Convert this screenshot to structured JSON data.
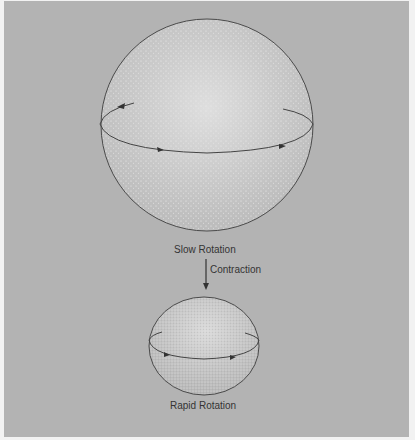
{
  "diagram": {
    "top_sphere": {
      "label": "Slow Rotation",
      "cx": 207,
      "cy": 125,
      "r": 106
    },
    "process": {
      "label": "Contraction"
    },
    "bottom_sphere": {
      "label": "Rapid Rotation",
      "cx": 204,
      "cy": 346,
      "rx": 55,
      "ry": 49
    },
    "colors": {
      "background": "#b3b3b3",
      "sphere_fill": "#c6c6c6",
      "outline": "#444444",
      "text": "#333333"
    }
  }
}
